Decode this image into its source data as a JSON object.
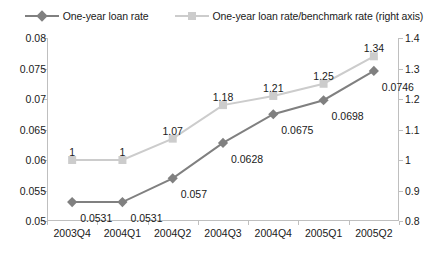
{
  "legend": {
    "position": "top-center",
    "entries": [
      {
        "label": "One-year loan rate",
        "marker": "diamond-marker-icon",
        "color": "#808080"
      },
      {
        "label": "One-year loan rate/benchmark rate (right axis)",
        "marker": "square-marker-icon",
        "color": "#cccccc"
      }
    ]
  },
  "chart_data": {
    "type": "line",
    "title": "",
    "subtitle": "",
    "xlabel": "",
    "ylabel": "",
    "grid": false,
    "legend_position": "top-center",
    "categories": [
      "2003Q4",
      "2004Q1",
      "2004Q2",
      "2004Q3",
      "2004Q4",
      "2005Q1",
      "2005Q2"
    ],
    "axes": {
      "left": {
        "ylim": [
          0.05,
          0.08
        ],
        "step": 0.005,
        "ticks": [
          "0.05",
          "0.055",
          "0.06",
          "0.065",
          "0.07",
          "0.075",
          "0.08"
        ],
        "tick_values": [
          0.05,
          0.055,
          0.06,
          0.065,
          0.07,
          0.075,
          0.08
        ]
      },
      "right": {
        "ylim": [
          0.8,
          1.4
        ],
        "step": 0.1,
        "ticks": [
          "0.8",
          "0.9",
          "1",
          "1.1",
          "1.2",
          "1.3",
          "1.4"
        ],
        "tick_values": [
          0.8,
          0.9,
          1.0,
          1.1,
          1.2,
          1.3,
          1.4
        ]
      }
    },
    "series": [
      {
        "name": "One-year loan rate",
        "axis": "left",
        "color": "#808080",
        "marker": "diamond",
        "values": [
          0.0531,
          0.0531,
          0.057,
          0.0628,
          0.0675,
          0.0698,
          0.0746
        ],
        "labels": [
          "0.0531",
          "0.0531",
          "0.057",
          "0.0628",
          "0.0675",
          "0.0698",
          "0.0746"
        ]
      },
      {
        "name": "One-year loan rate/benchmark rate (right axis)",
        "axis": "right",
        "color": "#cccccc",
        "marker": "square",
        "values": [
          1,
          1,
          1.07,
          1.18,
          1.21,
          1.25,
          1.34
        ],
        "labels": [
          "1",
          "1",
          "1.07",
          "1.18",
          "1.21",
          "1.25",
          "1.34"
        ]
      }
    ]
  }
}
